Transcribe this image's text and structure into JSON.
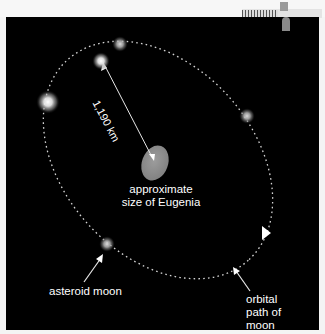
{
  "figure": {
    "background_color": "#000000",
    "orbit_color": "#d8d8d8",
    "asteroid": {
      "label_line1": "approximate",
      "label_line2": "size of Eugenia",
      "color": "#8c8c8c"
    },
    "distance_label": "1,190 km",
    "moon_label": "asteroid moon",
    "orbit_label_line1": "orbital",
    "orbit_label_line2": "path of",
    "orbit_label_line3": "moon",
    "moon_positions": [
      {
        "x": 120,
        "y": 44,
        "size": "small"
      },
      {
        "x": 100,
        "y": 60,
        "size": "medium"
      },
      {
        "x": 47,
        "y": 102,
        "size": "large"
      },
      {
        "x": 247,
        "y": 116,
        "size": "small"
      },
      {
        "x": 107,
        "y": 244,
        "size": "small"
      }
    ]
  }
}
